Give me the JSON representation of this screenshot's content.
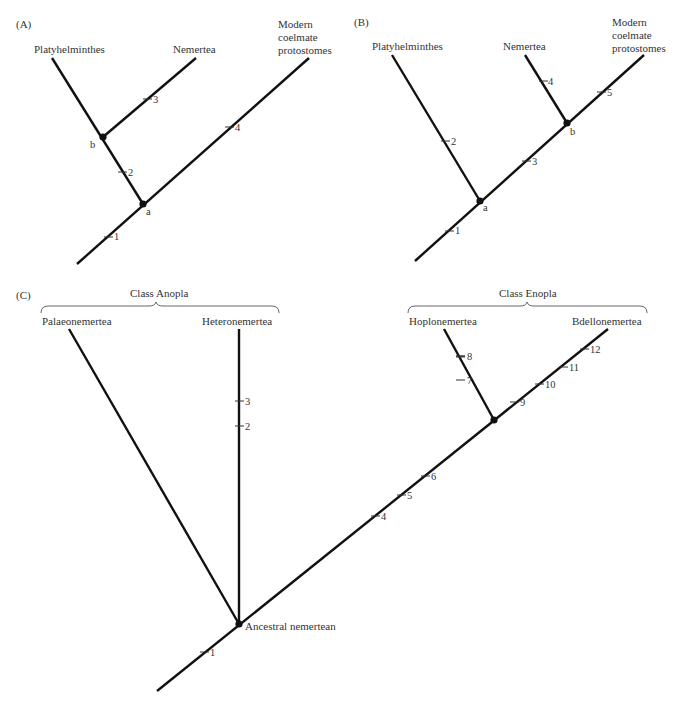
{
  "panels": [
    {
      "id": "A",
      "label": "(A)",
      "taxa": [
        "Platyhelminthes",
        "Nemertea",
        "Modern",
        "coelmate",
        "protostomes"
      ],
      "nodes": [
        "a",
        "b"
      ],
      "characters": [
        "1",
        "2",
        "3",
        "4"
      ]
    },
    {
      "id": "B",
      "label": "(B)",
      "taxa": [
        "Platyhelminthes",
        "Nemertea",
        "Modern",
        "coelmate",
        "protostomes"
      ],
      "nodes": [
        "a",
        "b"
      ],
      "characters": [
        "1",
        "2",
        "3",
        "4",
        "5"
      ]
    },
    {
      "id": "C",
      "label": "(C)",
      "groups": [
        "Class Anopla",
        "Class Enopla"
      ],
      "taxa": [
        "Palaeonemertea",
        "Heteronemertea",
        "Hoplonemertea",
        "Bdellonemertea"
      ],
      "root_label": "Ancestral nemertean",
      "characters": [
        "1",
        "2",
        "3",
        "4",
        "5",
        "6",
        "7",
        "8",
        "9",
        "10",
        "11",
        "12"
      ]
    }
  ]
}
